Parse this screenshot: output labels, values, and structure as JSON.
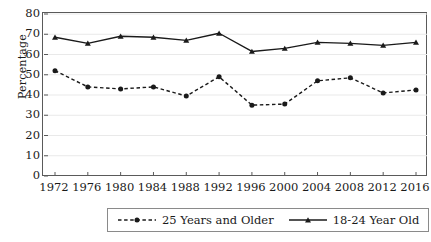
{
  "chart_data": {
    "type": "line",
    "title": "",
    "xlabel": "",
    "ylabel": "Percentage",
    "ylim": [
      0,
      80
    ],
    "ytick_step": 10,
    "grid": "horizontal",
    "legend_position": "below-center",
    "categories": [
      "1972",
      "1976",
      "1980",
      "1984",
      "1988",
      "1992",
      "1996",
      "2000",
      "2004",
      "2008",
      "2012",
      "2016"
    ],
    "series": [
      {
        "name": "25 Years and Older",
        "style": "dashed",
        "marker": "circle",
        "color": "#1a1a1a",
        "values": [
          52,
          44,
          43,
          44,
          39.5,
          49,
          35,
          35.5,
          47,
          48.5,
          41,
          42.5
        ]
      },
      {
        "name": "18-24 Year Old",
        "style": "solid",
        "marker": "triangle",
        "color": "#1a1a1a",
        "values": [
          68.5,
          65.5,
          69,
          68.5,
          67,
          70.5,
          61.5,
          63,
          66,
          65.5,
          64.5,
          66
        ]
      }
    ],
    "yticks": [
      "0",
      "10",
      "20",
      "30",
      "40",
      "50",
      "60",
      "70",
      "80"
    ],
    "axis_color": "#5a5a5a",
    "gridline_color": "#e9e9e9"
  },
  "legend": {
    "entries": [
      {
        "label": "25 Years and Older",
        "sample": "dashed-line-with-marker"
      },
      {
        "label": "18-24 Year Old",
        "sample": "solid-line-with-marker"
      }
    ]
  }
}
